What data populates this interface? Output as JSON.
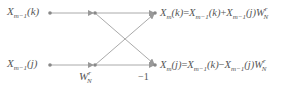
{
  "diagram": {
    "inputs": [
      {
        "base": "X",
        "sub": "m−1",
        "arg": "(k)"
      },
      {
        "base": "X",
        "sub": "m−1",
        "arg": "(j)"
      }
    ],
    "twiddle": {
      "base": "W",
      "sup": "r",
      "sub": "N"
    },
    "minus_one": "−1",
    "outputs": [
      {
        "lhs_base": "X",
        "lhs_sub": "m",
        "lhs_arg": "(k)",
        "eq": "=",
        "t1_base": "X",
        "t1_sub": "m−1",
        "t1_arg": "(k)",
        "op": "+",
        "t2_base": "X",
        "t2_sub": "m−1",
        "t2_arg": "(j)",
        "w_base": "W",
        "w_sup": "r",
        "w_sub": "N"
      },
      {
        "lhs_base": "X",
        "lhs_sub": "m",
        "lhs_arg": "(j)",
        "eq": "=",
        "t1_base": "X",
        "t1_sub": "m−1",
        "t1_arg": "(k)",
        "op": "−",
        "t2_base": "X",
        "t2_sub": "m−1",
        "t2_arg": "(j)",
        "w_base": "W",
        "w_sup": "r",
        "w_sub": "N"
      }
    ],
    "colors": {
      "line": "#aaaaaa",
      "node": "#888888",
      "text": "#555555"
    }
  }
}
